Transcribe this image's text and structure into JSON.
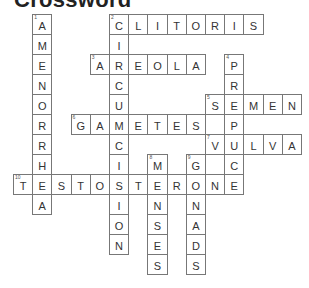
{
  "title": "Crossword",
  "grid": {
    "cell_width": 19.2,
    "cell_height": 20,
    "border_color": "#777777",
    "letter_color": "#333333"
  },
  "words": [
    {
      "number": 1,
      "direction": "down",
      "row": 0,
      "col": 1,
      "answer": "AMENORRHEA"
    },
    {
      "number": 2,
      "direction": "across",
      "row": 0,
      "col": 5,
      "answer": "CLITORIS"
    },
    {
      "number": 2,
      "direction": "down",
      "row": 0,
      "col": 5,
      "answer": "CIRCUMCISION"
    },
    {
      "number": 3,
      "direction": "across",
      "row": 2,
      "col": 4,
      "answer": "AREOLA"
    },
    {
      "number": 4,
      "direction": "down",
      "row": 2,
      "col": 11,
      "answer": "PREPUCE"
    },
    {
      "number": 5,
      "direction": "across",
      "row": 4,
      "col": 10,
      "answer": "SEMEN"
    },
    {
      "number": 6,
      "direction": "across",
      "row": 5,
      "col": 3,
      "answer": "GAMETES"
    },
    {
      "number": 7,
      "direction": "across",
      "row": 6,
      "col": 10,
      "answer": "VULVA"
    },
    {
      "number": 8,
      "direction": "down",
      "row": 7,
      "col": 7,
      "answer": "MENSES"
    },
    {
      "number": 9,
      "direction": "down",
      "row": 7,
      "col": 9,
      "answer": "GONADS"
    },
    {
      "number": 10,
      "direction": "across",
      "row": 8,
      "col": 0,
      "answer": "TESTOSTERONE"
    }
  ]
}
